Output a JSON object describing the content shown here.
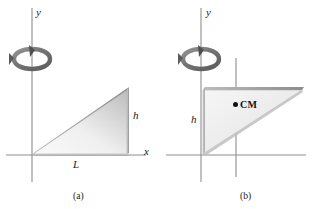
{
  "figure": {
    "background_color": "#ffffff",
    "ink_color": "#1a1a1a",
    "axis_color": "#8c8c8c",
    "plate_fill_light": "#f2f2f2",
    "plate_fill_dark": "#b4b4b4",
    "plate_edge_color": "#9a9a9a",
    "arrow_color": "#5a5a5a"
  },
  "panels": [
    {
      "id": "a",
      "caption": "(a)",
      "axes": {
        "y_label": "y",
        "x_label": "x"
      },
      "dimensions": [
        {
          "name": "base",
          "label": "L"
        },
        {
          "name": "height",
          "label": "h"
        }
      ],
      "rotation_icon": "rotation-arrow-icon",
      "shape": {
        "name": "right-triangle-plate",
        "vertices": [
          [
            32,
            155
          ],
          [
            128,
            155
          ],
          [
            128,
            88
          ]
        ]
      }
    },
    {
      "id": "b",
      "caption": "(b)",
      "axes": {
        "y_label": "y"
      },
      "dimensions": [
        {
          "name": "height",
          "label": "h"
        }
      ],
      "center_of_mass": {
        "label": "CM",
        "x": 236,
        "y": 105
      },
      "rotation_icon": "rotation-arrow-icon",
      "shape": {
        "name": "right-triangle-plate",
        "vertices": [
          [
            203,
            89
          ],
          [
            302,
            89
          ],
          [
            203,
            155
          ]
        ]
      }
    }
  ]
}
